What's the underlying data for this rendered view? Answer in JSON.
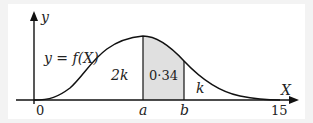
{
  "diagram": {
    "type": "probability-density-curve",
    "axes": {
      "y_label": "y",
      "x_label": "X",
      "origin_label": "0",
      "x_end_label": "15"
    },
    "curve_label": "y = f(X)",
    "markers": [
      {
        "name": "a",
        "label": "a"
      },
      {
        "name": "b",
        "label": "b"
      }
    ],
    "regions": [
      {
        "name": "left-of-a",
        "label": "2k",
        "shaded": false
      },
      {
        "name": "a-to-b",
        "label": "0·34",
        "shaded": true
      },
      {
        "name": "right-of-b",
        "label": "k",
        "shaded": false
      }
    ],
    "colors": {
      "shade": "#e0e0e0",
      "line": "#111111",
      "background": "#ffffff"
    }
  }
}
